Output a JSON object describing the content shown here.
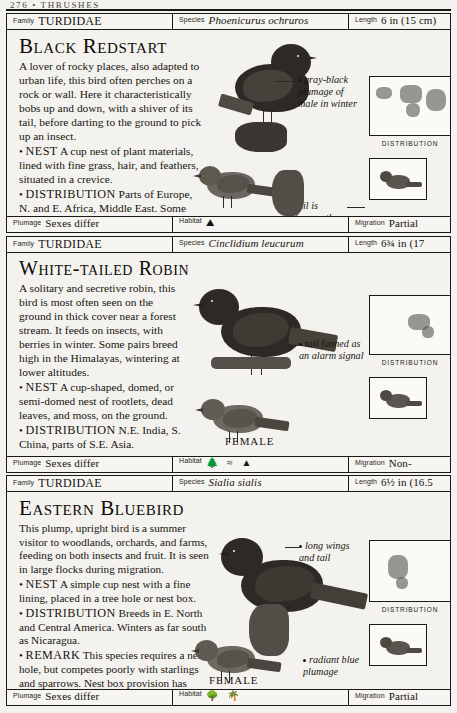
{
  "page": {
    "running_head": "276 • THRUSHES",
    "distribution_caption": "DISTRIBUTION"
  },
  "entries": [
    {
      "meta": {
        "family_key": "Family",
        "family_value": "TURDIDAE",
        "species_key": "Species",
        "species_value": "Phoenicurus ochruros",
        "length_key": "Length",
        "length_value": "6 in (15 cm)"
      },
      "title": "Black Redstart",
      "description": "A lover of rocky places, also adapted to urban life, this bird often perches on a rock or wall. Here it characteristically bobs up and down, with a shiver of its tail, before darting to the ground to pick up an insect.",
      "nest_label": "NEST",
      "nest_text": "A cup nest of plant materials, lined with fine grass, hair, and feathers, situated in a crevice.",
      "distribution_label": "DISTRIBUTION",
      "distribution_text": "Parts of Europe, N. and E. Africa, Middle East. Some southward migration in winter.",
      "callouts": [
        "gray-black plumage of male in winter",
        "tail is frequently wagged"
      ],
      "sex_label": "FEMALE",
      "status": {
        "plumage_key": "Plumage",
        "plumage_value": "Sexes differ",
        "habitat_key": "Habitat",
        "habitat_icons": [
          "rock-habitat-icon"
        ],
        "migration_key": "Migration",
        "migration_value": "Partial migrant"
      }
    },
    {
      "meta": {
        "family_key": "Family",
        "family_value": "TURDIDAE",
        "species_key": "Species",
        "species_value": "Cinclidium leucurum",
        "length_key": "Length",
        "length_value": "6¾ in (17 cm)"
      },
      "title": "White-tailed Robin",
      "description": "A solitary and secretive robin, this bird is most often seen on the ground in thick cover near a forest stream. It feeds on insects, with berries in winter. Some pairs breed high in the Himalayas, wintering at lower altitudes.",
      "nest_label": "NEST",
      "nest_text": "A cup-shaped, domed, or semi-domed nest of rootlets, dead leaves, and moss, on the ground.",
      "distribution_label": "DISTRIBUTION",
      "distribution_text": "N.E. India, S. China, parts of S.E. Asia.",
      "callouts": [
        "tail fanned as an alarm signal"
      ],
      "sex_label": "FEMALE",
      "status": {
        "plumage_key": "Plumage",
        "plumage_value": "Sexes differ",
        "habitat_key": "Habitat",
        "habitat_icons": [
          "forest-habitat-icon",
          "scrub-habitat-icon",
          "mountain-habitat-icon"
        ],
        "migration_key": "Migration",
        "migration_value": "Non-migrant"
      }
    },
    {
      "meta": {
        "family_key": "Family",
        "family_value": "TURDIDAE",
        "species_key": "Species",
        "species_value": "Sialia sialis",
        "length_key": "Length",
        "length_value": "6½ in (16.5 cm)"
      },
      "title": "Eastern Bluebird",
      "description": "This plump, upright bird is a summer visitor to woodlands, orchards, and farms, feeding on both insects and fruit. It is seen in large flocks during migration.",
      "nest_label": "NEST",
      "nest_text": "A simple cup nest with a fine lining, placed in a tree hole or nest box.",
      "distribution_label": "DISTRIBUTION",
      "distribution_text": "Breeds in E. North and Central America. Winters as far south as Nicaragua.",
      "remark_label": "REMARK",
      "remark_text": "This species requires a nest hole, but competes poorly with starlings and sparrows. Nest box provision has helped its survival.",
      "callouts": [
        "long wings and tail",
        "radiant blue plumage"
      ],
      "sex_label": "FEMALE",
      "status": {
        "plumage_key": "Plumage",
        "plumage_value": "Sexes differ",
        "habitat_key": "Habitat",
        "habitat_icons": [
          "woodland-habitat-icon",
          "orchard-habitat-icon"
        ],
        "migration_key": "Migration",
        "migration_value": "Partial migrant"
      }
    }
  ]
}
